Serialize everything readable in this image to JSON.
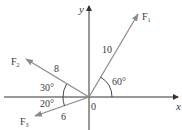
{
  "diagram": {
    "axes": {
      "x_label": "x",
      "y_label": "y",
      "origin_label": "0"
    },
    "vectors": [
      {
        "id": "F1",
        "label": "F",
        "subscript": "1",
        "magnitude": "10",
        "angle_label": "60°",
        "angle_deg": 60,
        "reference": "positive x-axis"
      },
      {
        "id": "F2",
        "label": "F",
        "subscript": "2",
        "magnitude": "8",
        "angle_label": "30°",
        "angle_deg": 30,
        "reference": "negative x-axis, above"
      },
      {
        "id": "F3",
        "label": "F",
        "subscript": "3",
        "magnitude": "6",
        "angle_label": "20°",
        "angle_deg": 20,
        "reference": "negative x-axis, below"
      }
    ],
    "colors": {
      "axis": "#333333",
      "vector": "#8a8a8a",
      "arc": "#333333",
      "text": "#3a3a3a"
    }
  }
}
